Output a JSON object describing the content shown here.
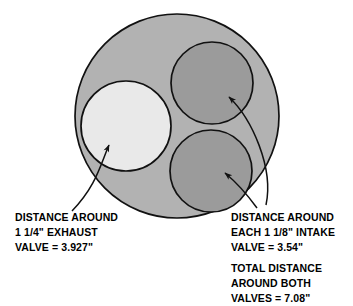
{
  "diagram": {
    "colors": {
      "outer_circle_fill": "#b2b2b2",
      "exhaust_valve_fill": "#e9e9e9",
      "intake_valve_fill": "#9b9b9b",
      "stroke": "#111111",
      "background": "#ffffff",
      "text": "#000000"
    },
    "shapes": {
      "outer_circle": {
        "cx": 177,
        "cy": 116,
        "r": 102,
        "label": "cylinder-bore"
      },
      "exhaust_valve": {
        "cx": 126,
        "cy": 126,
        "r": 45,
        "label": "exhaust-valve"
      },
      "intake_valve_top": {
        "cx": 212,
        "cy": 83,
        "r": 41,
        "label": "intake-valve-top"
      },
      "intake_valve_bottom": {
        "cx": 211,
        "cy": 171,
        "r": 41,
        "label": "intake-valve-bottom"
      }
    },
    "leaders": {
      "exhaust": {
        "path": "M 72 211 C 96 186, 100 166, 109 145",
        "tip": "109,145"
      },
      "intake_top": {
        "path": "M 266 205 C 272 170, 250 120, 228 97",
        "tip": "228,97"
      },
      "intake_bottom": {
        "path": "M 258 207 C 250 196, 236 182, 224 172",
        "tip": "224,172"
      }
    }
  },
  "callouts": {
    "exhaust": {
      "line1": "DISTANCE AROUND",
      "line2": "1 1/4\" EXHAUST",
      "line3": "VALVE = 3.927\""
    },
    "intake": {
      "line1": "DISTANCE AROUND",
      "line2": "EACH 1 1/8\" INTAKE",
      "line3": "VALVE = 3.54\""
    },
    "total": {
      "line1": "TOTAL DISTANCE",
      "line2": "AROUND BOTH",
      "line3": "VALVES = 7.08\""
    }
  }
}
